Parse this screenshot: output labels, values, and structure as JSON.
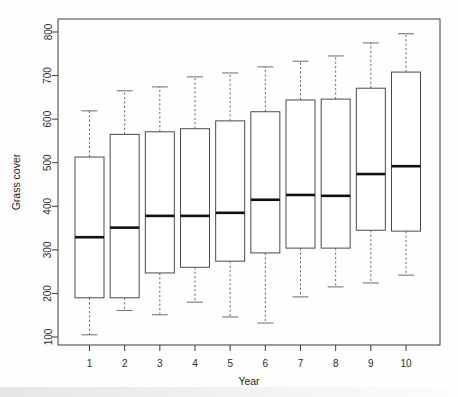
{
  "chart_data": {
    "type": "box",
    "title": "",
    "xlabel": "Year",
    "ylabel": "Grass cover",
    "xtick_labels": [
      "1",
      "2",
      "3",
      "4",
      "5",
      "6",
      "7",
      "8",
      "9",
      "10"
    ],
    "ytick_labels": [
      "100",
      "200",
      "300",
      "400",
      "500",
      "600",
      "700",
      "800"
    ],
    "ytick_values": [
      100,
      200,
      300,
      400,
      500,
      600,
      700,
      800
    ],
    "ylim": [
      75,
      820
    ],
    "grid": false,
    "legend": "none",
    "categories": [
      "1",
      "2",
      "3",
      "4",
      "5",
      "6",
      "7",
      "8",
      "9",
      "10"
    ],
    "boxes": [
      {
        "category": "1",
        "lower_whisker": 105,
        "q1": 190,
        "median": 329,
        "q3": 513,
        "upper_whisker": 619
      },
      {
        "category": "2",
        "lower_whisker": 161,
        "q1": 190,
        "median": 351,
        "q3": 565,
        "upper_whisker": 665
      },
      {
        "category": "3",
        "lower_whisker": 151,
        "q1": 247,
        "median": 378,
        "q3": 571,
        "upper_whisker": 674
      },
      {
        "category": "4",
        "lower_whisker": 180,
        "q1": 260,
        "median": 378,
        "q3": 578,
        "upper_whisker": 697
      },
      {
        "category": "5",
        "lower_whisker": 146,
        "q1": 274,
        "median": 385,
        "q3": 596,
        "upper_whisker": 706
      },
      {
        "category": "6",
        "lower_whisker": 132,
        "q1": 293,
        "median": 415,
        "q3": 617,
        "upper_whisker": 720
      },
      {
        "category": "7",
        "lower_whisker": 192,
        "q1": 304,
        "median": 426,
        "q3": 644,
        "upper_whisker": 733
      },
      {
        "category": "8",
        "lower_whisker": 215,
        "q1": 304,
        "median": 424,
        "q3": 646,
        "upper_whisker": 745
      },
      {
        "category": "9",
        "lower_whisker": 224,
        "q1": 345,
        "median": 474,
        "q3": 671,
        "upper_whisker": 775
      },
      {
        "category": "10",
        "lower_whisker": 242,
        "q1": 343,
        "median": 492,
        "q3": 708,
        "upper_whisker": 796
      }
    ]
  },
  "axes": {
    "y_title": "Grass cover",
    "x_title": "Year"
  },
  "colors": {
    "frame": "#3a3a3a",
    "box_stroke": "#4a4a4a",
    "median": "#111111",
    "whisker": "#6b6b6b",
    "background": "#ffffff"
  }
}
